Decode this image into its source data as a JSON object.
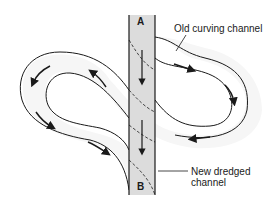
{
  "diagram": {
    "labels": {
      "old_channel": "Old curving channel",
      "new_channel_line1": "New dredged",
      "new_channel_line2": "channel",
      "point_a": "A",
      "point_b": "B"
    },
    "colors": {
      "stroke": "#1a1a1a",
      "dredged_fill": "#dcdcdc",
      "meander_fill": "#f6f6f6",
      "background": "#ffffff"
    },
    "flow_arrows": {
      "dredged_channel": 2,
      "old_channel": 8
    }
  }
}
